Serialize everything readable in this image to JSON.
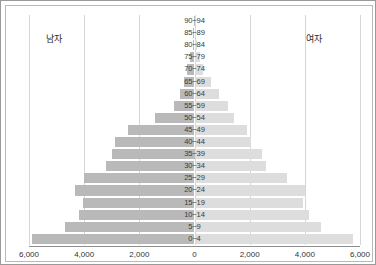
{
  "chart_data": {
    "type": "bar",
    "subtype": "population-pyramid",
    "title": "",
    "xlabel": "",
    "ylabel": "",
    "grid": true,
    "legend_position": "inside-top",
    "xlim": [
      -6000,
      6000
    ],
    "x_ticks": [
      "6,000",
      "4,000",
      "2,000",
      "0",
      "2,000",
      "4,000",
      "6,000"
    ],
    "x_tick_values": [
      -6000,
      -4000,
      -2000,
      0,
      2000,
      4000,
      6000
    ],
    "categories": [
      "90~94",
      "85~89",
      "80~84",
      "75~79",
      "70~74",
      "65~69",
      "60~64",
      "55~59",
      "50~54",
      "45~49",
      "40~44",
      "35~39",
      "30~34",
      "25~29",
      "20~24",
      "15~19",
      "10~14",
      "5~9",
      "0~4"
    ],
    "series": [
      {
        "name": "남자",
        "side": "left",
        "color": "#b9b9b9",
        "values": [
          20,
          40,
          70,
          180,
          260,
          390,
          540,
          760,
          1450,
          2420,
          2900,
          3000,
          3200,
          4000,
          4350,
          4050,
          4200,
          4700,
          5900
        ]
      },
      {
        "name": "여자",
        "side": "right",
        "color": "#dddddd",
        "values": [
          30,
          50,
          90,
          200,
          310,
          600,
          900,
          1200,
          1450,
          1900,
          2050,
          2450,
          2600,
          3350,
          4000,
          3950,
          4150,
          4600,
          5750
        ]
      }
    ]
  },
  "labels": {
    "male": "남자",
    "female": "여자"
  }
}
